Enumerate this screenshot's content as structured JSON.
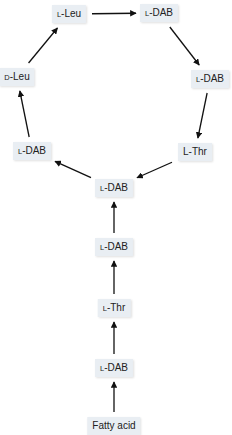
{
  "diagram": {
    "title": "",
    "nodes": [
      {
        "id": "n1",
        "prefix": "L",
        "name": "-Leu",
        "small_prefix": true
      },
      {
        "id": "n2",
        "prefix": "L",
        "name": "-DAB",
        "small_prefix": true
      },
      {
        "id": "n3",
        "prefix": "L",
        "name": "-DAB",
        "small_prefix": true
      },
      {
        "id": "n4",
        "prefix": "L",
        "name": "-Thr",
        "small_prefix": false
      },
      {
        "id": "n5",
        "prefix": "L",
        "name": "-DAB",
        "small_prefix": true
      },
      {
        "id": "n6",
        "prefix": "L",
        "name": "-DAB",
        "small_prefix": true
      },
      {
        "id": "n7",
        "prefix": "D",
        "name": "-Leu",
        "small_prefix": true
      },
      {
        "id": "n8",
        "prefix": "L",
        "name": "-DAB",
        "small_prefix": true
      },
      {
        "id": "n9",
        "prefix": "L",
        "name": "-Thr",
        "small_prefix": true
      },
      {
        "id": "n10",
        "prefix": "L",
        "name": "-DAB",
        "small_prefix": true
      },
      {
        "id": "n11",
        "prefix": "",
        "name": "Fatty acid",
        "small_prefix": false
      }
    ],
    "edges": [
      {
        "from": "n1",
        "to": "n2"
      },
      {
        "from": "n2",
        "to": "n3"
      },
      {
        "from": "n3",
        "to": "n4"
      },
      {
        "from": "n4",
        "to": "n5"
      },
      {
        "from": "n5",
        "to": "n6"
      },
      {
        "from": "n6",
        "to": "n7"
      },
      {
        "from": "n7",
        "to": "n1"
      },
      {
        "from": "n8",
        "to": "n5"
      },
      {
        "from": "n9",
        "to": "n8"
      },
      {
        "from": "n10",
        "to": "n9"
      },
      {
        "from": "n11",
        "to": "n10"
      }
    ]
  }
}
